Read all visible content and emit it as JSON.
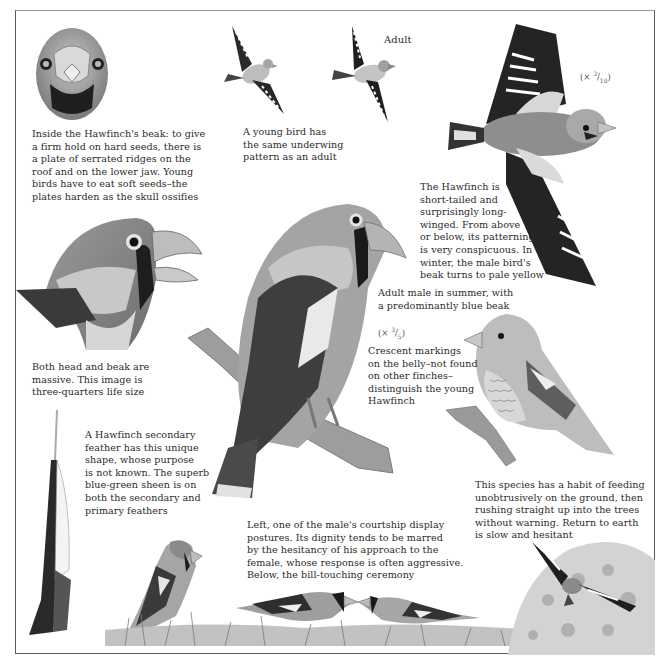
{
  "page": {
    "subject": "Hawfinch",
    "color_mode": "grayscale",
    "colors": {
      "text": "#2b2b2b",
      "frame": "#5a5a5a",
      "plumage_dark": "#2e2e2e",
      "plumage_mid": "#8a8a8a",
      "plumage_light": "#d4d4d4",
      "background": "#ffffff"
    }
  },
  "captions": {
    "beak_inside": "Inside the Hawfinch's beak: to give\na firm hold on hard seeds, there is\na plate of serrated ridges on the\nroof and on the lower jaw. Young\nbirds have to eat soft seeds–the\nplates harden as the skull ossifies",
    "young_underwing": "A young bird has\nthe same underwing\npattern as an adult",
    "adult_label": "Adult",
    "flight_scale": {
      "prefix": "(× ",
      "num": "3",
      "den": "10",
      "suffix": ")"
    },
    "short_tailed": "The Hawfinch is\nshort-tailed and\nsurprisingly long-\nwinged. From above\nor below, its patterning\nis very conspicuous. In\nwinter, the male bird's\nbeak turns to pale yellow",
    "adult_male": "Adult male in summer, with\na predominantly blue beak",
    "perched_scale": {
      "prefix": "(× ",
      "num": "3",
      "den": "5",
      "suffix": ")"
    },
    "crescent": "Crescent markings\non the belly–not found\non other finches–\ndistinguish the young\nHawfinch",
    "head_beak": "Both head and beak are\nmassive. This image is\nthree-quarters life size",
    "feather": "A Hawfinch secondary\nfeather has this unique\nshape, whose purpose\nis not known. The superb\nblue-green sheen is on\nboth the secondary and\nprimary feathers",
    "feeding": "This species has a habit of feeding\nunobtrusively on the ground, then\nrushing straight up into the trees\nwithout warning. Return to earth\nis slow and hesitant",
    "courtship": "Left, one of the male's courtship display\npostures. Its dignity tends to be marred\nby the hesitancy of his approach to the\nfemale, whose response is often aggressive.\nBelow, the bill-touching ceremony"
  },
  "illustrations": [
    "beak-front-view",
    "young-bird-underwing",
    "adult-underwing",
    "hawfinch-in-flight",
    "head-three-quarter-life-size",
    "adult-male-perched",
    "juvenile-perched",
    "secondary-feather",
    "courtship-display-male",
    "bill-touching-pair",
    "bird-rising-from-ground"
  ]
}
